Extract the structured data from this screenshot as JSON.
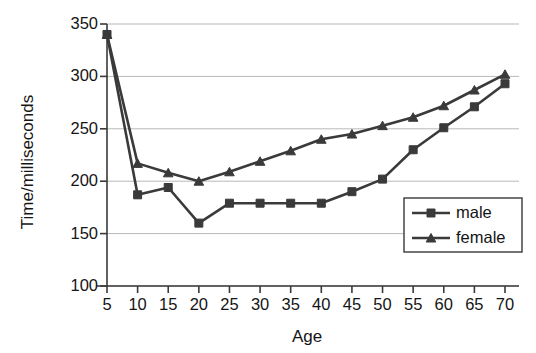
{
  "chart_data": {
    "type": "line",
    "title": "",
    "xlabel": "Age",
    "ylabel": "Time/milliseconds",
    "categories": [
      5,
      10,
      15,
      20,
      25,
      30,
      35,
      40,
      45,
      50,
      55,
      60,
      65,
      70
    ],
    "xtick_labels": [
      "5",
      "10",
      "15",
      "20",
      "25",
      "30",
      "35",
      "40",
      "45",
      "50",
      "55",
      "60",
      "65",
      "70"
    ],
    "ytick_labels": [
      "100",
      "150",
      "200",
      "250",
      "300",
      "350"
    ],
    "yticks": [
      100,
      150,
      200,
      250,
      300,
      350
    ],
    "ylim": [
      100,
      350
    ],
    "xlim": [
      5,
      70
    ],
    "grid": "horizontal",
    "legend_position": "inside-lower-right",
    "series": [
      {
        "name": "male",
        "marker": "square",
        "color": "#3a3a3a",
        "values": [
          340,
          187,
          194,
          160,
          179,
          179,
          179,
          179,
          190,
          202,
          230,
          251,
          271,
          293
        ]
      },
      {
        "name": "female",
        "marker": "triangle",
        "color": "#3a3a3a",
        "values": [
          340,
          217,
          208,
          200,
          209,
          219,
          229,
          240,
          245,
          253,
          261,
          272,
          287,
          302
        ]
      }
    ]
  },
  "legend": {
    "entries": [
      {
        "label": "male"
      },
      {
        "label": "female"
      }
    ]
  },
  "colors": {
    "series": "#3a3a3a",
    "grid": "#b9b9b9",
    "axis": "#3a3a3a",
    "text": "#151515",
    "background": "#ffffff"
  }
}
